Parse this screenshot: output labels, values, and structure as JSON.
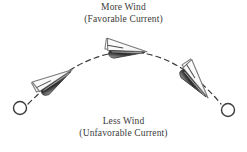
{
  "figure": {
    "type": "sailing-tactics-diagram",
    "background_color": "#ffffff",
    "top_label": {
      "line1": "More Wind",
      "line2": "(Favorable Current)"
    },
    "bottom_label": {
      "line1": "Less Wind",
      "line2": "(Unfavorable Current)"
    },
    "colors": {
      "text": "#3a3a3a",
      "hull_dark": "#2e2e2e",
      "hull_mid": "#8d8d8d",
      "sail_outline": "#6b6b6b",
      "path_dash": "#3c3c3c",
      "marker_outline": "#3c3c3c"
    },
    "path": {
      "style": "dashed-arc",
      "description": "Curved dashed route arcing upward between two circular marks",
      "start_marker": {
        "cx": 20,
        "cy": 108,
        "r": 6.5
      },
      "end_marker": {
        "cx": 228,
        "cy": 110,
        "r": 6.5
      }
    },
    "boats": [
      {
        "name": "boat-left",
        "x": 55,
        "y": 80,
        "rotation": -28,
        "scale": 1.0
      },
      {
        "name": "boat-top",
        "x": 127,
        "y": 50,
        "rotation": 8,
        "scale": 1.0
      },
      {
        "name": "boat-right",
        "x": 196,
        "y": 82,
        "rotation": 56,
        "scale": 1.0
      }
    ]
  }
}
